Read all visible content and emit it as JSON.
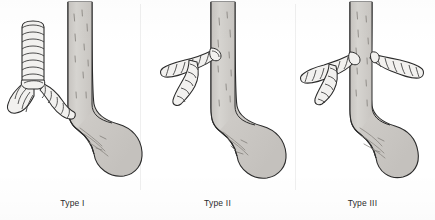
{
  "figure": {
    "background_color": "#ffffff",
    "width": 435,
    "height": 220,
    "panel_count": 3,
    "style": "line drawing with gray tonal shading, scanned book plate"
  },
  "colors": {
    "background": "#ffffff",
    "outline": "#2b2b2b",
    "organ_fill": "#cfccc8",
    "organ_fill_light": "#d8d6d2",
    "airway_fill": "#f2f1ef",
    "ring_line": "#3a3a3a",
    "texture_mark": "#8a8782",
    "caption_text": "#2b2b2b",
    "divider": "#efefef"
  },
  "panels": [
    {
      "id": "type-1",
      "caption": "Type I",
      "description": "Vertical trachea with cartilage rings descends and bifurcates at the carina into left and right main bronchi; the right-sided bronchus inserts directly into the esophageal wall. Esophagus runs vertically and widens into the stomach.",
      "anatomy": {
        "trachea": "vertical, ringed, full length",
        "carina": "present, low",
        "bronchi": [
          "left main bronchus",
          "right main bronchus to esophagus"
        ],
        "fistula_side": "right",
        "esophagus": "continuous vertical tube",
        "stomach": "present, right of esophagus"
      }
    },
    {
      "id": "type-2",
      "caption": "Type II",
      "description": "No vertical trachea shown; a ringed bronchial trunk arises horizontally from the left side of the esophagus and divides into an upper lateral branch and a descending lower branch. Esophagus continues into the stomach.",
      "anatomy": {
        "trachea": "absent from view",
        "carina": "lateral, on esophageal wall",
        "bronchi": [
          "upper lateral branch",
          "lower descending branch"
        ],
        "fistula_side": "left",
        "esophagus": "continuous vertical tube",
        "stomach": "present, right of esophagus"
      }
    },
    {
      "id": "type-3",
      "caption": "Type III",
      "description": "Ringed bronchi arise from both sides of the esophagus: a left-sided trunk dividing into lateral and descending branches, and a right-sided trunk passing laterally. Esophagus continues into the stomach.",
      "anatomy": {
        "trachea": "absent from view",
        "carina": "bilateral insertions on esophageal wall",
        "bronchi": [
          "left lateral branch",
          "left descending branch",
          "right lateral branch"
        ],
        "fistula_side": "bilateral",
        "esophagus": "continuous vertical tube",
        "stomach": "present, right of esophagus"
      }
    }
  ],
  "icons": {
    "panel_divider": "vertical-rule"
  }
}
